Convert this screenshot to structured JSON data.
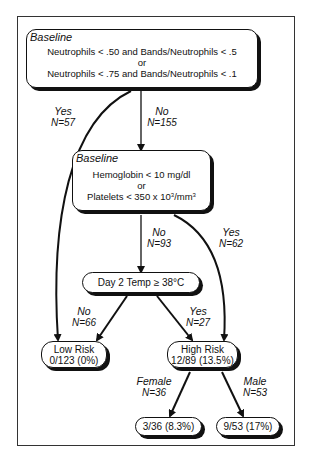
{
  "diagram": {
    "type": "decision-tree",
    "nodes": {
      "root": {
        "heading": "Baseline",
        "lines": [
          "Neutrophils < .50 and Bands/Neutrophils < .5",
          "or",
          "Neutrophils < .75 and Bands/Neutrophils  < .1"
        ]
      },
      "baseline2": {
        "heading": "Baseline",
        "lines": [
          "Hemoglobin < 10 mg/dl",
          "or",
          "Platelets < 350 x 10",
          "3",
          "/mm",
          "3"
        ]
      },
      "day2": {
        "label": "Day 2 Temp ≥ 38°C"
      },
      "low_risk": {
        "title": "Low Risk",
        "value": "0/123 (0%)"
      },
      "high_risk": {
        "title": "High Risk",
        "value": "12/89 (13.5%)"
      },
      "female_leaf": {
        "value": "3/36 (8.3%)"
      },
      "male_leaf": {
        "value": "9/53 (17%)"
      }
    },
    "edges": {
      "root_yes": {
        "label": "Yes",
        "n": "N=57"
      },
      "root_no": {
        "label": "No",
        "n": "N=155"
      },
      "b2_no": {
        "label": "No",
        "n": "N=93"
      },
      "b2_yes": {
        "label": "Yes",
        "n": "N=62"
      },
      "day2_no": {
        "label": "No",
        "n": "N=66"
      },
      "day2_yes": {
        "label": "Yes",
        "n": "N=27"
      },
      "hr_female": {
        "label": "Female",
        "n": "N=36"
      },
      "hr_male": {
        "label": "Male",
        "n": "N=53"
      }
    }
  }
}
